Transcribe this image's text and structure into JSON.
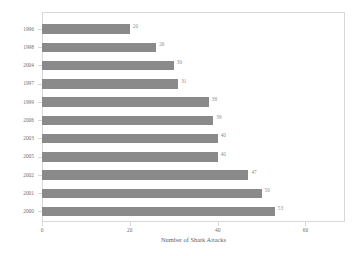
{
  "chart_data": {
    "type": "bar",
    "orientation": "horizontal",
    "title": "",
    "xlabel": "Number of Shark Attacks",
    "ylabel": "",
    "categories": [
      "1996",
      "1998",
      "2004",
      "1997",
      "1999",
      "2006",
      "2003",
      "2005",
      "2002",
      "2001",
      "2000"
    ],
    "values": [
      20,
      26,
      30,
      31,
      38,
      39,
      40,
      40,
      47,
      50,
      53
    ],
    "value_labels": [
      "20",
      "26",
      "30",
      "31",
      "38",
      "39",
      "40",
      "40",
      "47",
      "50",
      "53"
    ],
    "xlim": [
      0,
      69
    ],
    "xticks": [
      0,
      20,
      40,
      60
    ],
    "xtick_labels": [
      "0",
      "20",
      "40",
      "60"
    ],
    "grid": false,
    "legend": false,
    "colors": {
      "bar": "#8a8a8a",
      "value_label": "#8e8e8e",
      "axis_text": "#6f6f6f",
      "axis_title": "#5f5f5f",
      "frame": "#d8d8d8",
      "background": "#ffffff"
    }
  }
}
